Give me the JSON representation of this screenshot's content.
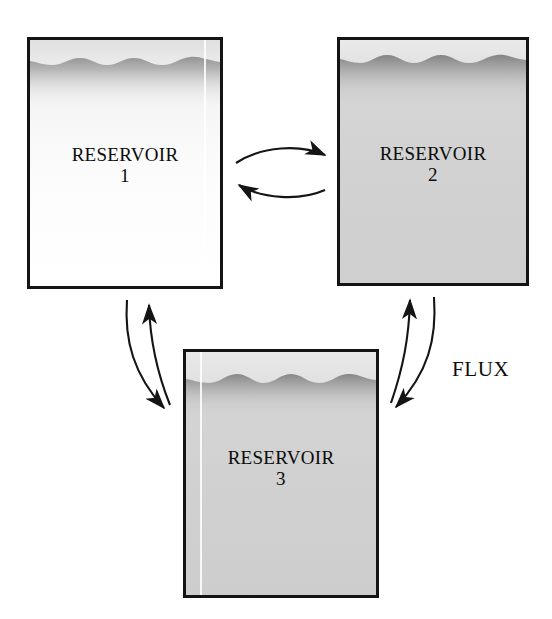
{
  "diagram": {
    "type": "box-and-arrow",
    "canvas": {
      "width": 552,
      "height": 619
    },
    "background_color": "#ffffff",
    "line_color": "#141414"
  },
  "reservoirs": [
    {
      "id": "reservoir-1",
      "name": "RESERVOIR",
      "index": "1",
      "fill_color": "#f7f7f7",
      "surface_color": "#9d9d9d",
      "has_streak": true
    },
    {
      "id": "reservoir-2",
      "name": "RESERVOIR",
      "index": "2",
      "fill_color": "#d2d2d2",
      "surface_color": "#8e8e8e",
      "has_streak": false
    },
    {
      "id": "reservoir-3",
      "name": "RESERVOIR",
      "index": "3",
      "fill_color": "#d0d0d0",
      "surface_color": "#8e8e8e",
      "has_streak": true
    }
  ],
  "flux": {
    "label": "FLUX"
  },
  "arrows": [
    {
      "id": "arrow-1-to-2",
      "from": "reservoir-1",
      "to": "reservoir-2",
      "direction": "right"
    },
    {
      "id": "arrow-2-to-1",
      "from": "reservoir-2",
      "to": "reservoir-1",
      "direction": "left"
    },
    {
      "id": "arrow-3-to-1",
      "from": "reservoir-3",
      "to": "reservoir-1",
      "direction": "up"
    },
    {
      "id": "arrow-1-to-3",
      "from": "reservoir-1",
      "to": "reservoir-3",
      "direction": "down"
    },
    {
      "id": "arrow-3-to-2",
      "from": "reservoir-3",
      "to": "reservoir-2",
      "direction": "up"
    },
    {
      "id": "arrow-2-to-3",
      "from": "reservoir-2",
      "to": "reservoir-3",
      "direction": "down"
    }
  ]
}
